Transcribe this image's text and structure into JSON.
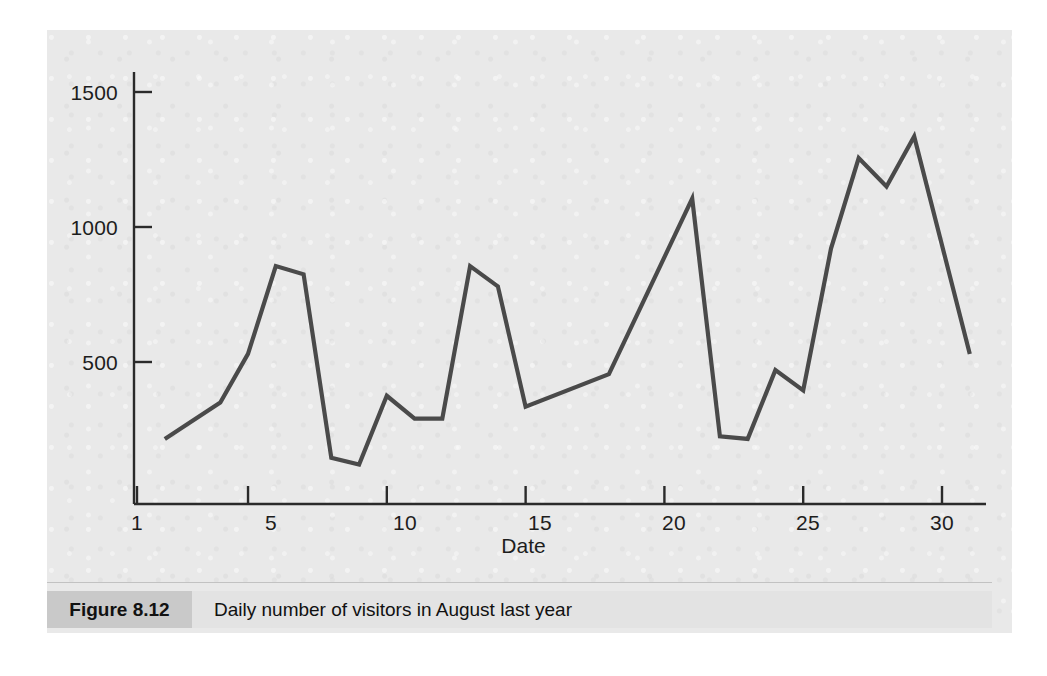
{
  "figure": {
    "number_label": "Figure 8.12",
    "caption": "Daily number of visitors in August last year"
  },
  "colors": {
    "page_background": "#e9e9e9",
    "line": "#4a4a4a",
    "axis": "#2a2a2a",
    "text": "#1d1d1d",
    "caption_bar": "#e3e3e3",
    "caption_number_bar": "#c9c9c9"
  },
  "chart_data": {
    "type": "line",
    "title": "",
    "xlabel": "Date",
    "ylabel": "",
    "xlim": [
      1,
      31
    ],
    "ylim": [
      0,
      1600
    ],
    "grid": false,
    "legend": null,
    "xticks": [
      1,
      5,
      10,
      15,
      20,
      25,
      30
    ],
    "xticklabels": [
      "1",
      "5",
      "10",
      "15",
      "20",
      "25",
      "30"
    ],
    "yticks": [
      500,
      1000,
      1500
    ],
    "yticklabels": [
      "500",
      "1000",
      "1500"
    ],
    "series": [
      {
        "name": "Daily number of visitors",
        "x": [
          2,
          4,
          5,
          6,
          7,
          8,
          9,
          10,
          11,
          12,
          13,
          14,
          15,
          18,
          21,
          22,
          23,
          24,
          25,
          26,
          27,
          28,
          29,
          31
        ],
        "values": [
          215,
          350,
          530,
          855,
          825,
          145,
          120,
          375,
          290,
          290,
          855,
          780,
          335,
          455,
          1105,
          225,
          215,
          470,
          395,
          920,
          1255,
          1150,
          1335,
          530
        ]
      }
    ]
  }
}
